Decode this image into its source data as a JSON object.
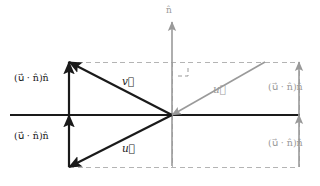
{
  "figure": {
    "type": "vector-diagram",
    "background_color": "#ffffff",
    "dark_color": "#1a1a1a",
    "gray_color": "#9a9a9a",
    "dash_color": "#b4b4b4"
  },
  "labels": {
    "normal_axis": "n̂",
    "v_vector": "v⃗",
    "u_vector_lower_left": "u⃗",
    "u_vector_right": "u⃗",
    "projection_upper_left": "(u⃗ · n̂)n̂",
    "projection_lower_left": "(u⃗ · n̂)n̂",
    "projection_upper_right": "(u⃗ · n̂)n̂",
    "projection_lower_right": "(u⃗ · n̂)n̂"
  },
  "chart_data": {
    "type": "scatter",
    "xlabel": "",
    "ylabel": "",
    "grid": false,
    "legend": false,
    "origin": {
      "x": 172,
      "y": 115
    },
    "axes": [
      {
        "name": "horizontal-plane-axis",
        "color": "#1a1a1a",
        "from": {
          "x": 10,
          "y": 115
        },
        "to": {
          "x": 300,
          "y": 115
        },
        "arrow": false,
        "width": 2.0
      },
      {
        "name": "normal-axis",
        "label": "n̂",
        "color": "#9a9a9a",
        "from": {
          "x": 172,
          "y": 166
        },
        "to": {
          "x": 172,
          "y": 22
        },
        "arrow": true,
        "width": 1.6
      }
    ],
    "vectors": [
      {
        "name": "v-vector",
        "label": "v⃗",
        "color": "#1a1a1a",
        "from": {
          "x": 172,
          "y": 115
        },
        "to": {
          "x": 69,
          "y": 62
        },
        "width": 2.2,
        "label_pos": {
          "x": 122,
          "y": 76
        }
      },
      {
        "name": "u-vector-lower-left",
        "label": "u⃗",
        "color": "#1a1a1a",
        "from": {
          "x": 172,
          "y": 115
        },
        "to": {
          "x": 69,
          "y": 167
        },
        "width": 2.2,
        "label_pos": {
          "x": 122,
          "y": 143
        }
      },
      {
        "name": "u-vector-right",
        "label": "u⃗",
        "color": "#9a9a9a",
        "from": {
          "x": 265,
          "y": 62
        },
        "to": {
          "x": 172,
          "y": 115
        },
        "width": 1.6,
        "label_pos": {
          "x": 213,
          "y": 84
        }
      },
      {
        "name": "projection-arrow-upper-left",
        "label": "(u⃗ · n̂)n̂",
        "color": "#1a1a1a",
        "from": {
          "x": 69,
          "y": 115
        },
        "to": {
          "x": 69,
          "y": 62
        },
        "width": 2.2,
        "label_pos": {
          "x": 14,
          "y": 73
        }
      },
      {
        "name": "projection-arrow-lower-left",
        "label": "(u⃗ · n̂)n̂",
        "color": "#1a1a1a",
        "from": {
          "x": 69,
          "y": 167
        },
        "to": {
          "x": 69,
          "y": 115
        },
        "width": 2.2,
        "label_pos": {
          "x": 14,
          "y": 131
        }
      },
      {
        "name": "projection-arrow-upper-right",
        "label": "(u⃗ · n̂)n̂",
        "color": "#9a9a9a",
        "from": {
          "x": 299,
          "y": 115
        },
        "to": {
          "x": 299,
          "y": 62
        },
        "width": 1.6,
        "label_pos": {
          "x": 268,
          "y": 82
        }
      },
      {
        "name": "projection-arrow-lower-right",
        "label": "(u⃗ · n̂)n̂",
        "color": "#9a9a9a",
        "from": {
          "x": 299,
          "y": 167
        },
        "to": {
          "x": 299,
          "y": 115
        },
        "width": 1.6,
        "label_pos": {
          "x": 268,
          "y": 138
        }
      }
    ],
    "dashed_guides": [
      {
        "name": "dashed-top",
        "from": {
          "x": 69,
          "y": 62
        },
        "to": {
          "x": 299,
          "y": 62
        }
      },
      {
        "name": "dashed-bottom",
        "from": {
          "x": 69,
          "y": 167
        },
        "to": {
          "x": 299,
          "y": 167
        }
      },
      {
        "name": "dashed-right",
        "from": {
          "x": 299,
          "y": 62
        },
        "to": {
          "x": 299,
          "y": 167
        }
      },
      {
        "name": "dashed-left",
        "from": {
          "x": 69,
          "y": 62
        },
        "to": {
          "x": 69,
          "y": 167
        }
      },
      {
        "name": "dashed-center-upper",
        "from": {
          "x": 172,
          "y": 62
        },
        "to": {
          "x": 172,
          "y": 115
        }
      },
      {
        "name": "dashed-center-lower",
        "from": {
          "x": 172,
          "y": 115
        },
        "to": {
          "x": 172,
          "y": 167
        }
      }
    ],
    "right_angle_marker": {
      "name": "right-angle-marker",
      "corner": {
        "x": 188,
        "y": 76
      },
      "size": 10,
      "color": "#9a9a9a"
    }
  }
}
